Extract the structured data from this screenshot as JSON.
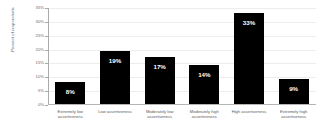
{
  "chart_data": {
    "type": "bar",
    "title": "",
    "xlabel": "",
    "ylabel": "Percent of respondents",
    "ylim": [
      0,
      35
    ],
    "grid": true,
    "legend": "none",
    "ytick_labels": [
      "0%",
      "5%",
      "10%",
      "15%",
      "20%",
      "25%",
      "30%",
      "35%"
    ],
    "ytick_values": [
      0,
      5,
      10,
      15,
      20,
      25,
      30,
      35
    ],
    "categories": [
      "Extremely low assertiveness",
      "Low assertiveness",
      "Moderately low assertiveness",
      "Moderately high assertiveness",
      "High assertiveness",
      "Extremely high assertiveness"
    ],
    "values": [
      8,
      19,
      17,
      14,
      33,
      9
    ],
    "data_labels": [
      "8%",
      "19%",
      "17%",
      "14%",
      "33%",
      "9%"
    ],
    "bar_color": "#000000",
    "data_label_color": "#ffffff",
    "background_color": "#ffffff",
    "axis_color": "#aaaaaa",
    "grid_color": "#ededed"
  }
}
